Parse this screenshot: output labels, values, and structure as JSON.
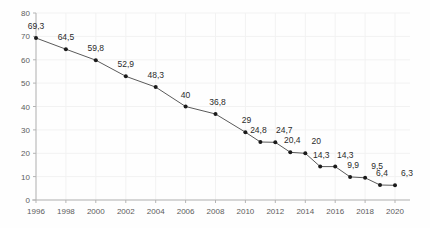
{
  "chart_data": {
    "type": "line",
    "title": "",
    "subtitle": "",
    "xlabel": "",
    "ylabel": "",
    "grid": true,
    "legend": null,
    "decimal_separator": ",",
    "xlim": [
      1996,
      2020
    ],
    "ylim": [
      0,
      80
    ],
    "y_ticks": [
      0,
      10,
      20,
      30,
      40,
      50,
      60,
      70,
      80
    ],
    "y_tick_labels": [
      "0",
      "10",
      "20",
      "30",
      "40",
      "50",
      "60",
      "70",
      "80"
    ],
    "x_ticks": [
      1996,
      1998,
      2000,
      2002,
      2004,
      2006,
      2008,
      2010,
      2012,
      2014,
      2016,
      2018,
      2020
    ],
    "x_tick_labels": [
      "1996",
      "1998",
      "2000",
      "2002",
      "2004",
      "2006",
      "2008",
      "2010",
      "2012",
      "2014",
      "2016",
      "2018",
      "2020"
    ],
    "x": [
      1996,
      1998,
      2000,
      2002,
      2004,
      2006,
      2008,
      2010,
      2011,
      2012,
      2013,
      2014,
      2015,
      2016,
      2017,
      2018,
      2019,
      2020
    ],
    "values": [
      69.3,
      64.5,
      59.8,
      52.9,
      48.3,
      40,
      36.8,
      29,
      24.8,
      24.7,
      20.4,
      20,
      14.3,
      14.3,
      9.9,
      9.5,
      6.4,
      6.3
    ],
    "point_labels": [
      "69,3",
      "64,5",
      "59,8",
      "52,9",
      "48,3",
      "40",
      "36,8",
      "29",
      "24,8",
      "24,7",
      "20,4",
      "20",
      "14,3",
      "14,3",
      "9,9",
      "9,5",
      "6,4",
      "6,3"
    ],
    "colors": {
      "line": "#5a5a5a",
      "marker": "#1a1a1a",
      "grid": "#f2f2f2",
      "axis": "#b4b4b4",
      "tick_text": "#5c5c5c",
      "label_text": "#2b2b2b",
      "background": "#fefefe"
    }
  }
}
